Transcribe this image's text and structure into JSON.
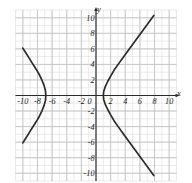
{
  "figure": {
    "name": "hyperbola-graph",
    "background": "#ffffff",
    "corner_note": "",
    "colors": {
      "curve": "#2b2b2b",
      "axis": "#2b2b2b",
      "major_grid": "#c4c4c4",
      "minor_grid": "#dedede",
      "label": "#1a1a1a"
    }
  },
  "chart_data": {
    "type": "line",
    "title": "",
    "subtitle": "",
    "xlabel": "x",
    "ylabel": "y",
    "xlim": [
      -11,
      11
    ],
    "ylim": [
      -11,
      11
    ],
    "grid": true,
    "minor_grid_step": 1,
    "major_grid_step": 2,
    "legend": "none",
    "x_ticks": [
      -10,
      -8,
      -6,
      -4,
      -2,
      0,
      2,
      4,
      6,
      8,
      10
    ],
    "x_tick_labels": [
      "-10",
      "-8",
      "-6",
      "-4",
      "-2",
      "0",
      "2",
      "4",
      "6",
      "8",
      "10"
    ],
    "y_ticks": [
      -10,
      -8,
      -6,
      -4,
      -2,
      2,
      4,
      6,
      8,
      10
    ],
    "y_tick_labels": [
      "-10",
      "-8",
      "-6",
      "-4",
      "-2",
      "2",
      "4",
      "6",
      "8",
      "10"
    ],
    "annotations": [],
    "series": [
      {
        "name": "left-branch",
        "style": "solid",
        "points": [
          [
            -10.0,
            6.1
          ],
          [
            -9.6,
            5.5
          ],
          [
            -9.2,
            4.9
          ],
          [
            -8.8,
            4.3
          ],
          [
            -8.4,
            3.7
          ],
          [
            -8.0,
            3.1
          ],
          [
            -7.7,
            2.6
          ],
          [
            -7.4,
            2.0
          ],
          [
            -7.1,
            1.3
          ],
          [
            -6.9,
            0.6
          ],
          [
            -6.85,
            0.0
          ],
          [
            -6.9,
            -0.6
          ],
          [
            -7.1,
            -1.3
          ],
          [
            -7.4,
            -2.0
          ],
          [
            -7.7,
            -2.6
          ],
          [
            -8.0,
            -3.1
          ],
          [
            -8.4,
            -3.7
          ],
          [
            -8.8,
            -4.3
          ],
          [
            -9.2,
            -4.9
          ],
          [
            -9.6,
            -5.5
          ],
          [
            -10.0,
            -6.1
          ]
        ]
      },
      {
        "name": "right-branch",
        "style": "solid",
        "points": [
          [
            7.9,
            10.3
          ],
          [
            7.2,
            9.4
          ],
          [
            6.5,
            8.5
          ],
          [
            5.8,
            7.6
          ],
          [
            5.1,
            6.7
          ],
          [
            4.4,
            5.8
          ],
          [
            3.7,
            4.9
          ],
          [
            3.1,
            4.1
          ],
          [
            2.5,
            3.3
          ],
          [
            2.0,
            2.5
          ],
          [
            1.6,
            1.8
          ],
          [
            1.25,
            1.1
          ],
          [
            1.05,
            0.5
          ],
          [
            1.0,
            0.0
          ],
          [
            1.05,
            -0.5
          ],
          [
            1.25,
            -1.1
          ],
          [
            1.6,
            -1.8
          ],
          [
            2.0,
            -2.5
          ],
          [
            2.5,
            -3.3
          ],
          [
            3.1,
            -4.1
          ],
          [
            3.7,
            -4.9
          ],
          [
            4.4,
            -5.8
          ],
          [
            5.1,
            -6.7
          ],
          [
            5.8,
            -7.6
          ],
          [
            6.5,
            -8.5
          ],
          [
            7.2,
            -9.4
          ],
          [
            7.9,
            -10.3
          ]
        ]
      }
    ]
  }
}
